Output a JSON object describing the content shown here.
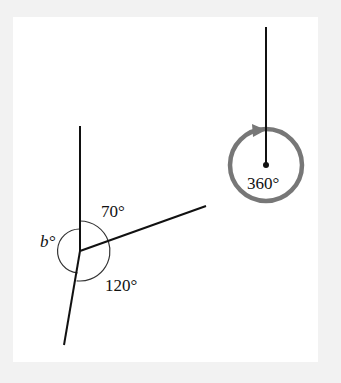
{
  "figure": {
    "background_color": "#f2f2f2",
    "panel_color": "#ffffff",
    "line_color": "#111111",
    "circle_color": "#777777"
  },
  "left_diagram": {
    "labels": {
      "angle_top": "70°",
      "angle_left": "b°",
      "angle_bottom": "120°"
    },
    "angles": [
      {
        "name": "top",
        "value": 70,
        "unit": "degrees"
      },
      {
        "name": "left",
        "value": "b",
        "unit": "degrees",
        "unknown": true
      },
      {
        "name": "bottom",
        "value": 120,
        "unit": "degrees"
      }
    ]
  },
  "right_diagram": {
    "labels": {
      "full_turn": "360°"
    },
    "angle": {
      "value": 360,
      "unit": "degrees",
      "description": "full turn"
    }
  }
}
